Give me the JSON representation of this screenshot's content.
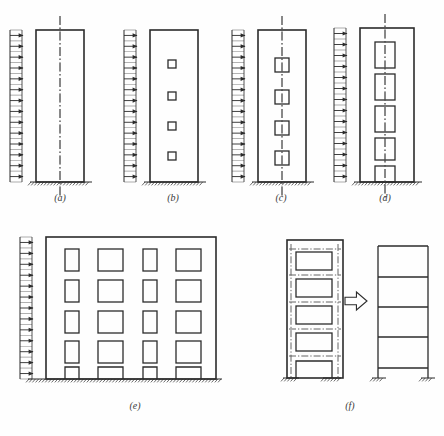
{
  "figure": {
    "background_color": "#fefefe",
    "line_color": "#2b2b2b",
    "centerline_color": "#555555",
    "panels": [
      {
        "id": "a",
        "label": "(a)",
        "caption_x": 60,
        "caption_y": 196,
        "description": "solid cantilever shear wall with uniform lateral load and vertical centre line",
        "wall": {
          "x": 36,
          "y": 30,
          "w": 48,
          "h": 152
        },
        "load": {
          "x": 22,
          "y": 30,
          "h": 152,
          "arrows": 14,
          "direction": "right"
        },
        "ground": {
          "x": 30,
          "y": 182,
          "w": 62
        },
        "centerline": {
          "x": 60,
          "y1": 16,
          "y2": 196
        },
        "openings": []
      },
      {
        "id": "b",
        "label": "(b)",
        "caption_x": 173,
        "caption_y": 196,
        "description": "wall with four small openings, no centre line",
        "wall": {
          "x": 150,
          "y": 30,
          "w": 48,
          "h": 152
        },
        "load": {
          "x": 136,
          "y": 30,
          "h": 152,
          "arrows": 14,
          "direction": "right"
        },
        "ground": {
          "x": 144,
          "y": 182,
          "w": 62
        },
        "centerline": null,
        "openings": [
          {
            "x": 168,
            "y": 60,
            "w": 8,
            "h": 8
          },
          {
            "x": 168,
            "y": 92,
            "w": 8,
            "h": 8
          },
          {
            "x": 168,
            "y": 122,
            "w": 8,
            "h": 8
          },
          {
            "x": 168,
            "y": 152,
            "w": 8,
            "h": 8
          }
        ]
      },
      {
        "id": "c",
        "label": "(c)",
        "caption_x": 281,
        "caption_y": 196,
        "description": "wall with four medium square openings on a dash-dot centre line",
        "wall": {
          "x": 258,
          "y": 30,
          "w": 48,
          "h": 152
        },
        "load": {
          "x": 244,
          "y": 30,
          "h": 152,
          "arrows": 14,
          "direction": "right"
        },
        "ground": {
          "x": 252,
          "y": 182,
          "w": 62
        },
        "centerline": {
          "x": 282,
          "y1": 16,
          "y2": 196
        },
        "openings": [
          {
            "x": 275,
            "y": 58,
            "w": 14,
            "h": 14
          },
          {
            "x": 275,
            "y": 90,
            "w": 14,
            "h": 14
          },
          {
            "x": 275,
            "y": 121,
            "w": 14,
            "h": 14
          },
          {
            "x": 275,
            "y": 151,
            "w": 14,
            "h": 14
          }
        ]
      },
      {
        "id": "d",
        "label": "(d)",
        "caption_x": 385,
        "caption_y": 196,
        "description": "coupled shear wall with five tall openings on a dash-dot centre line",
        "wall": {
          "x": 360,
          "y": 28,
          "w": 54,
          "h": 154
        },
        "load": {
          "x": 346,
          "y": 28,
          "h": 154,
          "arrows": 14,
          "direction": "right"
        },
        "ground": {
          "x": 354,
          "y": 182,
          "w": 68
        },
        "centerline": {
          "x": 385,
          "y1": 14,
          "y2": 200
        },
        "openings": [
          {
            "x": 375,
            "y": 42,
            "w": 20,
            "h": 26
          },
          {
            "x": 375,
            "y": 74,
            "w": 20,
            "h": 26
          },
          {
            "x": 375,
            "y": 106,
            "w": 20,
            "h": 26
          },
          {
            "x": 375,
            "y": 138,
            "w": 20,
            "h": 22
          },
          {
            "x": 375,
            "y": 166,
            "w": 20,
            "h": 16
          }
        ]
      },
      {
        "id": "e",
        "label": "(e)",
        "caption_x": 135,
        "caption_y": 404,
        "description": "perforated wall / pierced frame with 5 storeys and 4 bays of openings under uniform lateral load",
        "wall": {
          "x": 46,
          "y": 237,
          "w": 170,
          "h": 142
        },
        "load": {
          "x": 32,
          "y": 237,
          "h": 142,
          "arrows": 13,
          "direction": "right"
        },
        "ground": {
          "x": 28,
          "y": 379,
          "w": 194
        },
        "centerline": null,
        "openings": [
          {
            "x": 65,
            "y": 249,
            "w": 14,
            "h": 22
          },
          {
            "x": 98,
            "y": 249,
            "w": 25,
            "h": 22
          },
          {
            "x": 143,
            "y": 249,
            "w": 14,
            "h": 22
          },
          {
            "x": 176,
            "y": 249,
            "w": 25,
            "h": 22
          },
          {
            "x": 65,
            "y": 280,
            "w": 14,
            "h": 22
          },
          {
            "x": 98,
            "y": 280,
            "w": 25,
            "h": 22
          },
          {
            "x": 143,
            "y": 280,
            "w": 14,
            "h": 22
          },
          {
            "x": 176,
            "y": 280,
            "w": 25,
            "h": 22
          },
          {
            "x": 65,
            "y": 311,
            "w": 14,
            "h": 22
          },
          {
            "x": 98,
            "y": 311,
            "w": 25,
            "h": 22
          },
          {
            "x": 143,
            "y": 311,
            "w": 14,
            "h": 22
          },
          {
            "x": 176,
            "y": 311,
            "w": 25,
            "h": 22
          },
          {
            "x": 65,
            "y": 341,
            "w": 14,
            "h": 22
          },
          {
            "x": 98,
            "y": 341,
            "w": 25,
            "h": 22
          },
          {
            "x": 143,
            "y": 341,
            "w": 14,
            "h": 22
          },
          {
            "x": 176,
            "y": 341,
            "w": 25,
            "h": 22
          }
        ],
        "door_openings": [
          {
            "x": 65,
            "y": 367,
            "w": 14,
            "h": 12
          },
          {
            "x": 98,
            "y": 367,
            "w": 25,
            "h": 12
          },
          {
            "x": 143,
            "y": 367,
            "w": 14,
            "h": 12
          },
          {
            "x": 176,
            "y": 367,
            "w": 25,
            "h": 12
          }
        ]
      },
      {
        "id": "f",
        "label": "(f)",
        "caption_x": 350,
        "caption_y": 404,
        "description": "pierced wall idealised as an equivalent plane frame, linked by a hollow arrow",
        "left": {
          "wall": {
            "x": 287,
            "y": 240,
            "w": 56,
            "h": 138
          },
          "ground_left": {
            "x": 283,
            "y": 378,
            "w": 16
          },
          "ground_right": {
            "x": 323,
            "y": 378,
            "w": 18
          },
          "openings": [
            {
              "x": 296,
              "y": 252,
              "w": 36,
              "h": 18
            },
            {
              "x": 296,
              "y": 279,
              "w": 36,
              "h": 18
            },
            {
              "x": 296,
              "y": 306,
              "w": 36,
              "h": 18
            },
            {
              "x": 296,
              "y": 333,
              "w": 36,
              "h": 18
            }
          ],
          "door": {
            "x": 296,
            "y": 361,
            "w": 36,
            "h": 17
          },
          "frame_columns_x": [
            291,
            338
          ],
          "frame_beams_y": [
            249,
            275,
            302,
            329,
            356
          ]
        },
        "arrow": {
          "x": 345,
          "y": 292,
          "w": 22,
          "h": 18,
          "direction": "right",
          "style": "hollow-outline"
        },
        "right": {
          "frame": {
            "x": 378,
            "y": 246,
            "w": 50,
            "h": 132
          },
          "columns_x": [
            378,
            428
          ],
          "beams_y": [
            246,
            277,
            307,
            337,
            368
          ],
          "ground_left": {
            "x": 372,
            "y": 378,
            "w": 14
          },
          "ground_right": {
            "x": 421,
            "y": 378,
            "w": 14
          }
        }
      }
    ]
  }
}
